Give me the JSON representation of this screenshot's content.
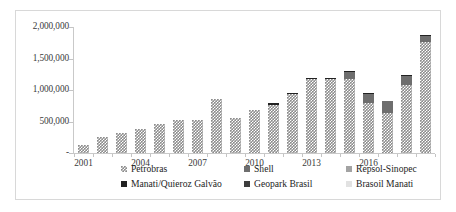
{
  "chart_data": {
    "type": "bar",
    "subtype": "stacked-column",
    "title": "",
    "xlabel": "",
    "ylabel": "",
    "ylim": [
      0,
      2000000
    ],
    "grid": false,
    "legend_position": "bottom",
    "y_ticks": [
      "-",
      "500,000",
      "1,000,000",
      "1,500,000",
      "2,000,000"
    ],
    "y_tick_values": [
      0,
      500000,
      1000000,
      1500000,
      2000000
    ],
    "categories": [
      "2001",
      "2002",
      "2003",
      "2004",
      "2005",
      "2006",
      "2007",
      "2008",
      "2009",
      "2010",
      "2011",
      "2012",
      "2013",
      "2014",
      "2015",
      "2016",
      "2017",
      "2018",
      "2019"
    ],
    "x_tick_labels": [
      "2001",
      "2004",
      "2007",
      "2010",
      "2013",
      "2016"
    ],
    "x_tick_categories": [
      0,
      3,
      6,
      9,
      12,
      15
    ],
    "series": [
      {
        "name": "Petrobras",
        "color": "#8c8c8c",
        "pattern": "checkered",
        "values": [
          130000,
          260000,
          315000,
          380000,
          460000,
          530000,
          530000,
          860000,
          560000,
          680000,
          760000,
          930000,
          1170000,
          1170000,
          1170000,
          800000,
          640000,
          1080000,
          1760000
        ]
      },
      {
        "name": "Shell",
        "color": "#6e6e6e",
        "values": [
          0,
          0,
          0,
          0,
          0,
          0,
          0,
          0,
          0,
          0,
          0,
          0,
          0,
          0,
          115000,
          140000,
          180000,
          145000,
          100000
        ]
      },
      {
        "name": "Repsol-Sinopec",
        "color": "#a3a3a3",
        "values": [
          0,
          0,
          0,
          0,
          0,
          0,
          0,
          0,
          0,
          0,
          0,
          0,
          0,
          0,
          0,
          0,
          0,
          0,
          0
        ]
      },
      {
        "name": "Manati/Quieroz Galvão",
        "color": "#222222",
        "values": [
          0,
          0,
          0,
          0,
          0,
          0,
          0,
          0,
          0,
          0,
          30000,
          25000,
          20000,
          20000,
          15000,
          10000,
          10000,
          10000,
          10000
        ]
      },
      {
        "name": "Geopark Brasil",
        "color": "#3d3d3d",
        "values": [
          0,
          0,
          0,
          0,
          0,
          0,
          0,
          0,
          0,
          0,
          0,
          0,
          0,
          0,
          0,
          0,
          0,
          0,
          0
        ]
      },
      {
        "name": "Brasoil Manati",
        "color": "#e2e2e2",
        "values": [
          0,
          0,
          0,
          0,
          0,
          0,
          0,
          0,
          0,
          0,
          0,
          0,
          0,
          0,
          0,
          0,
          0,
          0,
          0
        ]
      }
    ]
  },
  "legend": {
    "items": [
      {
        "label": "Petrobras",
        "swatch_class": "s-petrobras"
      },
      {
        "label": "Shell",
        "swatch_class": "s-shell"
      },
      {
        "label": "Repsol-Sinopec",
        "swatch_class": "s-repsol"
      },
      {
        "label": "Manati/Quieroz Galvão",
        "swatch_class": "s-manati"
      },
      {
        "label": "Geopark Brasil",
        "swatch_class": "s-geopark"
      },
      {
        "label": "Brasoil Manati",
        "swatch_class": "s-brasoil"
      }
    ]
  }
}
